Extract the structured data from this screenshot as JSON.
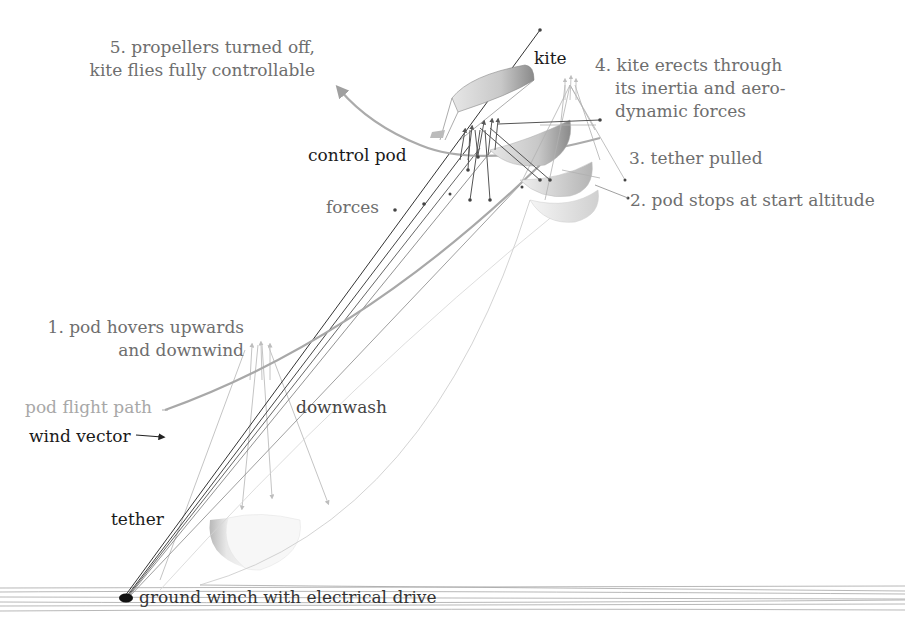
{
  "diagram": {
    "steps": [
      {
        "number": "1.",
        "line1": "1. pod hovers upwards",
        "line2": "and downwind"
      },
      {
        "number": "2.",
        "line1": "2. pod stops at start altitude"
      },
      {
        "number": "3.",
        "line1": "3. tether pulled"
      },
      {
        "number": "4.",
        "line1": "4. kite erects through",
        "line2": "its inertia and aero-",
        "line3": "dynamic forces"
      },
      {
        "number": "5.",
        "line1": "5. propellers turned off,",
        "line2": "kite flies fully controllable"
      }
    ],
    "labels": {
      "kite": "kite",
      "control_pod": "control pod",
      "forces": "forces",
      "downwash": "downwash",
      "pod_flight_path": "pod flight path",
      "wind_vector": "wind vector",
      "tether": "tether",
      "ground_winch": "ground winch with electrical drive"
    },
    "colors": {
      "dark_ink": "#1a1a1a",
      "step_text": "#6e6e6e",
      "path_text": "#a8a8a8",
      "flight_path": "#a0a0a0",
      "kite_fill": "#cfcfcf",
      "ground": "#9a9a9a"
    }
  }
}
